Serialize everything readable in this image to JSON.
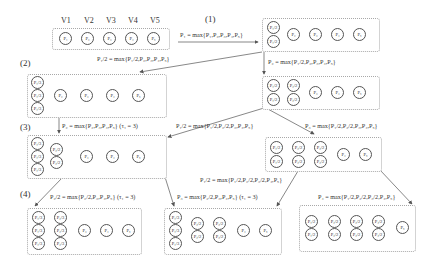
{
  "vertices": [
    "V1",
    "V2",
    "V3",
    "V4",
    "V5"
  ],
  "steps": [
    "(1)",
    "(2)",
    "(3)",
    "(4)"
  ],
  "equations": {
    "e1": "P₁ = max{P₁,P₂,P₃,P₄,P₅}",
    "e2": "P₁/2 = max{P₁/2,P₂,P₃,P₄,P₅}",
    "e3": "P₂ = max{P₁/2,P₂,P₃,P₄,P₅}",
    "e4": "P₂ = max{P₂,P₃,P₄,P₅} (τ₁ = 3)",
    "e5": "P₁/2 = max{P₁/2,P₂/2,P₃,P₄,P₅}",
    "e6": "P₃ = max{P₁/2,P₂/2,P₃,P₄,P₅}",
    "e7": "P₂/2 = max{P₂/2,P₃,P₄,P₅} (τ₁ = 3)",
    "e8": "P₁/2 = max{P₁/2,P₂/2,P₃/2,P₄,P₅}",
    "e9": "P₃ = max{P₂/2,P₃,P₄,P₅} (τ₁ = 3)",
    "e10": "P₄ = max{P₁/2,P₂/2,P₃/2,P₄,P₅}"
  },
  "nodes": {
    "p1": "P₁",
    "p2": "P₂",
    "p3": "P₃",
    "p4": "P₄",
    "p5": "P₅",
    "p1h": "P₁/2",
    "p2h": "P₂/2",
    "p3h": "P₃/2",
    "p4h": "P₄/2",
    "p1t": "P₁/3",
    "p2t": "P₂/3"
  },
  "colors": {
    "line": "#555555",
    "box_border": "#a8a8a8",
    "text": "#333333"
  }
}
